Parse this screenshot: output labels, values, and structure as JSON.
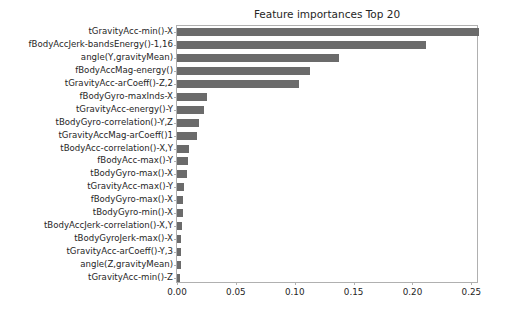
{
  "chart_data": {
    "type": "bar",
    "orientation": "horizontal",
    "title": "Feature importances Top 20",
    "xlabel": "",
    "ylabel": "",
    "xlim": [
      0.0,
      0.2565
    ],
    "grid": false,
    "legend": null,
    "bar_color": "#6b6b6b",
    "xticks": [
      "0.00",
      "0.05",
      "0.10",
      "0.15",
      "0.20",
      "0.25"
    ],
    "xtick_values": [
      0.0,
      0.05,
      0.1,
      0.15,
      0.2,
      0.25
    ],
    "categories": [
      "tGravityAcc-min()-X",
      "fBodyAccJerk-bandsEnergy()-1,16",
      "angle(Y,gravityMean)",
      "fBodyAccMag-energy()",
      "tGravityAcc-arCoeff()-Z,2",
      "fBodyGyro-maxInds-X",
      "tGravityAcc-energy()-Y",
      "tBodyGyro-correlation()-Y,Z",
      "tGravityAccMag-arCoeff()1",
      "tBodyAcc-correlation()-X,Y",
      "fBodyAcc-max()-Y",
      "tBodyGyro-max()-X",
      "tGravityAcc-max()-Y",
      "fBodyGyro-max()-X",
      "tBodyGyro-min()-X",
      "tBodyAccJerk-correlation()-X,Y",
      "tBodyGyroJerk-max()-X",
      "tGravityAcc-arCoeff()-Y,3",
      "angle(Z,gravityMean)",
      "tGravityAcc-min()-Z"
    ],
    "values": [
      0.2565,
      0.2115,
      0.1375,
      0.113,
      0.104,
      0.0255,
      0.0232,
      0.019,
      0.017,
      0.0105,
      0.0092,
      0.0086,
      0.006,
      0.0053,
      0.0048,
      0.0042,
      0.0038,
      0.0034,
      0.003,
      0.0028
    ]
  }
}
